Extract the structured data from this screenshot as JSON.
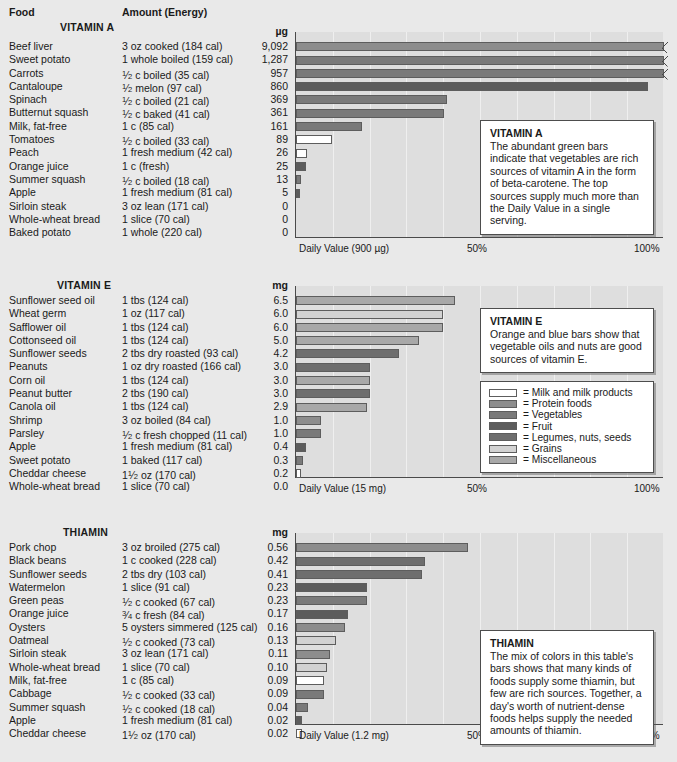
{
  "table_headers": {
    "food": "Food",
    "amount": "Amount (Energy)"
  },
  "palette": {
    "milk": "#ffffff",
    "protein": "#8d8d8d",
    "vegetables": "#7a7a7a",
    "fruit": "#5c5c5c",
    "legumes": "#6e6e6e",
    "grains": "#d2d2d2",
    "miscellaneous": "#a8a8a8",
    "plot_bg": "#dedede",
    "axis": "#4a4a4a",
    "page_bg": "#e9e9e9"
  },
  "legend": {
    "items": [
      {
        "label": "= Milk and milk products",
        "key": "milk"
      },
      {
        "label": "= Protein foods",
        "key": "protein"
      },
      {
        "label": "= Vegetables",
        "key": "vegetables"
      },
      {
        "label": "= Fruit",
        "key": "fruit"
      },
      {
        "label": "= Legumes, nuts, seeds",
        "key": "legumes"
      },
      {
        "label": "= Grains",
        "key": "grains"
      },
      {
        "label": "= Miscellaneous",
        "key": "miscellaneous"
      }
    ]
  },
  "axis_ticks": {
    "mid": "50%",
    "end": "100%"
  },
  "chart_data": [
    {
      "type": "bar",
      "title": "VITAMIN A",
      "unit": "µg",
      "xlabel": "Daily Value (900 µg)",
      "daily_value": 900,
      "xlim": [
        0,
        100
      ],
      "grid": true,
      "legend": "external",
      "annotation": "The abundant green bars indicate that vegetables are rich sources of vitamin A in the form of beta-carotene. The top sources supply much more than the Daily Value in a single serving.",
      "categories": [
        "Beef liver",
        "Sweet potato",
        "Carrots",
        "Cantaloupe",
        "Spinach",
        "Butternut squash",
        "Milk, fat-free",
        "Tomatoes",
        "Peach",
        "Orange juice",
        "Summer squash",
        "Apple",
        "Sirloin steak",
        "Whole-wheat bread",
        "Baked potato"
      ],
      "amounts": [
        "3 oz cooked (184 cal)",
        "1 whole boiled (159 cal)",
        "1/2 c boiled (35 cal)",
        "1/2 melon (97 cal)",
        "1/2 c boiled (21 cal)",
        "1/2 c baked (41 cal)",
        "1 c (85 cal)",
        "1/2 c boiled (33 cal)",
        "1 fresh medium (42 cal)",
        "1 c (fresh)",
        "1/2 c boiled (18 cal)",
        "1 fresh medium (81 cal)",
        "3 oz lean (171 cal)",
        "1 slice (70 cal)",
        "1 whole (220 cal)"
      ],
      "values": [
        9092,
        1287,
        957,
        860,
        369,
        361,
        161,
        89,
        26,
        25,
        13,
        5,
        0,
        0,
        0
      ],
      "value_labels": [
        "9,092",
        "1,287",
        "957",
        "860",
        "369",
        "361",
        "161",
        "89",
        "26",
        "25",
        "13",
        "5",
        "0",
        "0",
        "0"
      ],
      "percents": [
        100,
        100,
        100,
        95.6,
        41.0,
        40.1,
        17.9,
        9.9,
        2.9,
        2.8,
        1.4,
        0.6,
        0,
        0,
        0
      ],
      "broken": [
        true,
        true,
        true,
        false,
        false,
        false,
        false,
        false,
        false,
        false,
        false,
        false,
        false,
        false,
        false
      ],
      "groups": [
        "protein",
        "vegetables",
        "vegetables",
        "fruit",
        "vegetables",
        "vegetables",
        "vegetables",
        "milk",
        "milk",
        "fruit",
        "vegetables",
        "fruit",
        "protein",
        "grains",
        "vegetables"
      ]
    },
    {
      "type": "bar",
      "title": "VITAMIN E",
      "unit": "mg",
      "xlabel": "Daily Value (15 mg)",
      "daily_value": 15,
      "xlim": [
        0,
        100
      ],
      "grid": true,
      "legend": "inline",
      "annotation": "Orange and blue bars show that vegetable oils and nuts are good sources of vitamin E.",
      "categories": [
        "Sunflower seed oil",
        "Wheat germ",
        "Safflower oil",
        "Cottonseed oil",
        "Sunflower seeds",
        "Peanuts",
        "Corn oil",
        "Peanut butter",
        "Canola oil",
        "Shrimp",
        "Parsley",
        "Apple",
        "Sweet potato",
        "Cheddar cheese",
        "Whole-wheat bread"
      ],
      "amounts": [
        "1 tbs (124 cal)",
        "1 oz (117 cal)",
        "1 tbs (124 cal)",
        "1 tbs (124 cal)",
        "2 tbs dry roasted (93 cal)",
        "1 oz dry roasted (166 cal)",
        "1 tbs (124 cal)",
        "2 tbs (190 cal)",
        "1 tbs (124 cal)",
        "3 oz boiled (84 cal)",
        "1/2 c fresh chopped (11 cal)",
        "1 fresh medium (81 cal)",
        "1 baked (117 cal)",
        "1 1/2 oz (170 cal)",
        "1 slice (70 cal)"
      ],
      "values": [
        6.5,
        6.0,
        6.0,
        5.0,
        4.2,
        3.0,
        3.0,
        3.0,
        2.9,
        1.0,
        1.0,
        0.4,
        0.3,
        0.2,
        0.0
      ],
      "value_labels": [
        "6.5",
        "6.0",
        "6.0",
        "5.0",
        "4.2",
        "3.0",
        "3.0",
        "3.0",
        "2.9",
        "1.0",
        "1.0",
        "0.4",
        "0.3",
        "0.2",
        "0.0"
      ],
      "percents": [
        43.3,
        40.0,
        40.0,
        33.3,
        28.0,
        20.0,
        20.0,
        20.0,
        19.3,
        6.7,
        6.7,
        2.7,
        2.0,
        1.3,
        0
      ],
      "broken": [
        false,
        false,
        false,
        false,
        false,
        false,
        false,
        false,
        false,
        false,
        false,
        false,
        false,
        false,
        false
      ],
      "groups": [
        "miscellaneous",
        "grains",
        "miscellaneous",
        "miscellaneous",
        "legumes",
        "legumes",
        "miscellaneous",
        "legumes",
        "miscellaneous",
        "protein",
        "vegetables",
        "fruit",
        "vegetables",
        "milk",
        "grains"
      ]
    },
    {
      "type": "bar",
      "title": "THIAMIN",
      "unit": "mg",
      "xlabel": "Daily Value (1.2 mg)",
      "daily_value": 1.2,
      "xlim": [
        0,
        100
      ],
      "grid": true,
      "legend": "external",
      "annotation": "The mix of colors in this table's bars shows that many kinds of foods supply some thiamin, but few are rich sources. Together, a day's worth of nutrient-dense foods helps supply the needed amounts of thiamin.",
      "categories": [
        "Pork chop",
        "Black beans",
        "Sunflower seeds",
        "Watermelon",
        "Green peas",
        "Orange juice",
        "Oysters",
        "Oatmeal",
        "Sirloin steak",
        "Whole-wheat bread",
        "Milk, fat-free",
        "Cabbage",
        "Summer squash",
        "Apple",
        "Cheddar cheese"
      ],
      "amounts": [
        "3 oz broiled  (275 cal)",
        "1 c cooked (228 cal)",
        "2 tbs dry (103 cal)",
        "1 slice (91 cal)",
        "1/2 c cooked (67 cal)",
        "3/4 c fresh (84 cal)",
        "5 oysters simmered (125 cal)",
        "1/2 c cooked (73 cal)",
        "3 oz lean (171 cal)",
        "1 slice (70 cal)",
        "1 c (85 cal)",
        "1/2 c cooked (33 cal)",
        "1/2 c cooked (18 cal)",
        "1 fresh medium (81 cal)",
        "1 1/2 oz (170 cal)"
      ],
      "values": [
        0.56,
        0.42,
        0.41,
        0.23,
        0.23,
        0.17,
        0.16,
        0.13,
        0.11,
        0.1,
        0.09,
        0.09,
        0.04,
        0.02,
        0.02
      ],
      "value_labels": [
        "0.56",
        "0.42",
        "0.41",
        "0.23",
        "0.23",
        "0.17",
        "0.16",
        "0.13",
        "0.11",
        "0.10",
        "0.09",
        "0.09",
        "0.04",
        "0.02",
        "0.02"
      ],
      "percents": [
        46.7,
        35.0,
        34.2,
        19.2,
        19.2,
        14.2,
        13.3,
        10.8,
        9.2,
        8.3,
        7.5,
        7.5,
        3.3,
        1.7,
        1.7
      ],
      "broken": [
        false,
        false,
        false,
        false,
        false,
        false,
        false,
        false,
        false,
        false,
        false,
        false,
        false,
        false,
        false
      ],
      "groups": [
        "protein",
        "legumes",
        "legumes",
        "fruit",
        "vegetables",
        "fruit",
        "protein",
        "grains",
        "protein",
        "grains",
        "milk",
        "vegetables",
        "vegetables",
        "fruit",
        "milk"
      ]
    }
  ]
}
